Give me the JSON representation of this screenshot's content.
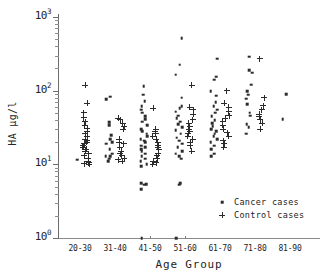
{
  "chart_data": {
    "type": "scatter",
    "title": "",
    "xlabel": "Age Group",
    "ylabel": "HA µg/l",
    "yscale": "log",
    "ylim": [
      1,
      1000
    ],
    "ytick_labels": [
      "10",
      "10",
      "10",
      "10"
    ],
    "ytick_exponents": [
      "0",
      "1",
      "2",
      "3"
    ],
    "ytick_values": [
      1,
      10,
      100,
      1000
    ],
    "grid": false,
    "categories": [
      "20-30",
      "31-40",
      "41-50",
      "51-60",
      "61-70",
      "71-80",
      "81-90"
    ],
    "legend_position": "lower-right",
    "series": [
      {
        "name": "Cancer cases",
        "marker": "dot",
        "color": "#2b2b2b",
        "points": [
          {
            "category": "20-30",
            "value": 11.5
          },
          {
            "category": "31-40",
            "value": 83
          },
          {
            "category": "31-40",
            "value": 76
          },
          {
            "category": "31-40",
            "value": 37
          },
          {
            "category": "31-40",
            "value": 34
          },
          {
            "category": "31-40",
            "value": 25
          },
          {
            "category": "31-40",
            "value": 22
          },
          {
            "category": "31-40",
            "value": 20
          },
          {
            "category": "31-40",
            "value": 19
          },
          {
            "category": "31-40",
            "value": 16
          },
          {
            "category": "31-40",
            "value": 14
          },
          {
            "category": "31-40",
            "value": 13
          },
          {
            "category": "31-40",
            "value": 13
          },
          {
            "category": "31-40",
            "value": 12
          },
          {
            "category": "31-40",
            "value": 11
          },
          {
            "category": "41-50",
            "value": 115
          },
          {
            "category": "41-50",
            "value": 88
          },
          {
            "category": "41-50",
            "value": 72
          },
          {
            "category": "41-50",
            "value": 62
          },
          {
            "category": "41-50",
            "value": 55
          },
          {
            "category": "41-50",
            "value": 50
          },
          {
            "category": "41-50",
            "value": 45
          },
          {
            "category": "41-50",
            "value": 41
          },
          {
            "category": "41-50",
            "value": 38
          },
          {
            "category": "41-50",
            "value": 34
          },
          {
            "category": "41-50",
            "value": 30
          },
          {
            "category": "41-50",
            "value": 28
          },
          {
            "category": "41-50",
            "value": 26
          },
          {
            "category": "41-50",
            "value": 24
          },
          {
            "category": "41-50",
            "value": 22
          },
          {
            "category": "41-50",
            "value": 21
          },
          {
            "category": "41-50",
            "value": 20
          },
          {
            "category": "41-50",
            "value": 18
          },
          {
            "category": "41-50",
            "value": 17
          },
          {
            "category": "41-50",
            "value": 16
          },
          {
            "category": "41-50",
            "value": 15
          },
          {
            "category": "41-50",
            "value": 14
          },
          {
            "category": "41-50",
            "value": 13
          },
          {
            "category": "41-50",
            "value": 12
          },
          {
            "category": "41-50",
            "value": 11
          },
          {
            "category": "41-50",
            "value": 10
          },
          {
            "category": "41-50",
            "value": 9.5
          },
          {
            "category": "41-50",
            "value": 5.5
          },
          {
            "category": "41-50",
            "value": 5.4
          },
          {
            "category": "41-50",
            "value": 5.3
          },
          {
            "category": "41-50",
            "value": 4.6
          },
          {
            "category": "41-50",
            "value": 1.0
          },
          {
            "category": "51-60",
            "value": 520
          },
          {
            "category": "51-60",
            "value": 225
          },
          {
            "category": "51-60",
            "value": 165
          },
          {
            "category": "51-60",
            "value": 80
          },
          {
            "category": "51-60",
            "value": 62
          },
          {
            "category": "51-60",
            "value": 58
          },
          {
            "category": "51-60",
            "value": 52
          },
          {
            "category": "51-60",
            "value": 46
          },
          {
            "category": "51-60",
            "value": 42
          },
          {
            "category": "51-60",
            "value": 38
          },
          {
            "category": "51-60",
            "value": 35
          },
          {
            "category": "51-60",
            "value": 32
          },
          {
            "category": "51-60",
            "value": 29
          },
          {
            "category": "51-60",
            "value": 26
          },
          {
            "category": "51-60",
            "value": 23
          },
          {
            "category": "51-60",
            "value": 21
          },
          {
            "category": "51-60",
            "value": 19
          },
          {
            "category": "51-60",
            "value": 17
          },
          {
            "category": "51-60",
            "value": 15
          },
          {
            "category": "51-60",
            "value": 14
          },
          {
            "category": "51-60",
            "value": 13
          },
          {
            "category": "51-60",
            "value": 12
          },
          {
            "category": "51-60",
            "value": 5.5
          },
          {
            "category": "51-60",
            "value": 5.3
          },
          {
            "category": "51-60",
            "value": 1.0
          },
          {
            "category": "61-70",
            "value": 270
          },
          {
            "category": "61-70",
            "value": 155
          },
          {
            "category": "61-70",
            "value": 140
          },
          {
            "category": "61-70",
            "value": 98
          },
          {
            "category": "61-70",
            "value": 85
          },
          {
            "category": "61-70",
            "value": 70
          },
          {
            "category": "61-70",
            "value": 62
          },
          {
            "category": "61-70",
            "value": 55
          },
          {
            "category": "61-70",
            "value": 50
          },
          {
            "category": "61-70",
            "value": 45
          },
          {
            "category": "61-70",
            "value": 40
          },
          {
            "category": "61-70",
            "value": 36
          },
          {
            "category": "61-70",
            "value": 33
          },
          {
            "category": "61-70",
            "value": 30
          },
          {
            "category": "61-70",
            "value": 28
          },
          {
            "category": "61-70",
            "value": 26
          },
          {
            "category": "61-70",
            "value": 24
          },
          {
            "category": "61-70",
            "value": 22
          },
          {
            "category": "61-70",
            "value": 20
          },
          {
            "category": "61-70",
            "value": 18
          },
          {
            "category": "61-70",
            "value": 16
          },
          {
            "category": "61-70",
            "value": 14
          },
          {
            "category": "61-70",
            "value": 13
          },
          {
            "category": "71-80",
            "value": 290
          },
          {
            "category": "71-80",
            "value": 190
          },
          {
            "category": "71-80",
            "value": 175
          },
          {
            "category": "71-80",
            "value": 120
          },
          {
            "category": "71-80",
            "value": 98
          },
          {
            "category": "71-80",
            "value": 88
          },
          {
            "category": "71-80",
            "value": 78
          },
          {
            "category": "71-80",
            "value": 66
          },
          {
            "category": "71-80",
            "value": 50
          },
          {
            "category": "71-80",
            "value": 46
          },
          {
            "category": "71-80",
            "value": 35
          },
          {
            "category": "71-80",
            "value": 32
          },
          {
            "category": "71-80",
            "value": 26
          },
          {
            "category": "81-90",
            "value": 90
          },
          {
            "category": "81-90",
            "value": 41
          }
        ]
      },
      {
        "name": "Control cases",
        "marker": "plus",
        "color": "#2b2b2b",
        "points": [
          {
            "category": "20-30",
            "value": 118
          },
          {
            "category": "20-30",
            "value": 68
          },
          {
            "category": "20-30",
            "value": 50
          },
          {
            "category": "20-30",
            "value": 43
          },
          {
            "category": "20-30",
            "value": 38
          },
          {
            "category": "20-30",
            "value": 34
          },
          {
            "category": "20-30",
            "value": 31
          },
          {
            "category": "20-30",
            "value": 28
          },
          {
            "category": "20-30",
            "value": 26
          },
          {
            "category": "20-30",
            "value": 24
          },
          {
            "category": "20-30",
            "value": 22
          },
          {
            "category": "20-30",
            "value": 21
          },
          {
            "category": "20-30",
            "value": 20
          },
          {
            "category": "20-30",
            "value": 19
          },
          {
            "category": "20-30",
            "value": 18
          },
          {
            "category": "20-30",
            "value": 17
          },
          {
            "category": "20-30",
            "value": 16
          },
          {
            "category": "20-30",
            "value": 15
          },
          {
            "category": "20-30",
            "value": 14
          },
          {
            "category": "20-30",
            "value": 13
          },
          {
            "category": "20-30",
            "value": 12
          },
          {
            "category": "20-30",
            "value": 11
          },
          {
            "category": "20-30",
            "value": 10.5
          },
          {
            "category": "20-30",
            "value": 10.2
          },
          {
            "category": "20-30",
            "value": 10
          },
          {
            "category": "31-40",
            "value": 42
          },
          {
            "category": "31-40",
            "value": 40
          },
          {
            "category": "31-40",
            "value": 36
          },
          {
            "category": "31-40",
            "value": 33
          },
          {
            "category": "31-40",
            "value": 30
          },
          {
            "category": "31-40",
            "value": 22
          },
          {
            "category": "31-40",
            "value": 20
          },
          {
            "category": "31-40",
            "value": 19
          },
          {
            "category": "31-40",
            "value": 17
          },
          {
            "category": "31-40",
            "value": 15
          },
          {
            "category": "31-40",
            "value": 14
          },
          {
            "category": "31-40",
            "value": 13
          },
          {
            "category": "31-40",
            "value": 12
          },
          {
            "category": "31-40",
            "value": 11.5
          },
          {
            "category": "31-40",
            "value": 11
          },
          {
            "category": "41-50",
            "value": 58
          },
          {
            "category": "41-50",
            "value": 30
          },
          {
            "category": "41-50",
            "value": 28
          },
          {
            "category": "41-50",
            "value": 26
          },
          {
            "category": "41-50",
            "value": 24
          },
          {
            "category": "41-50",
            "value": 22
          },
          {
            "category": "41-50",
            "value": 20
          },
          {
            "category": "41-50",
            "value": 18
          },
          {
            "category": "41-50",
            "value": 17
          },
          {
            "category": "41-50",
            "value": 16
          },
          {
            "category": "41-50",
            "value": 14
          },
          {
            "category": "41-50",
            "value": 13
          },
          {
            "category": "41-50",
            "value": 12
          },
          {
            "category": "41-50",
            "value": 11
          },
          {
            "category": "41-50",
            "value": 10.5
          },
          {
            "category": "41-50",
            "value": 10
          },
          {
            "category": "51-60",
            "value": 118
          },
          {
            "category": "51-60",
            "value": 60
          },
          {
            "category": "51-60",
            "value": 55
          },
          {
            "category": "51-60",
            "value": 48
          },
          {
            "category": "51-60",
            "value": 40
          },
          {
            "category": "51-60",
            "value": 36
          },
          {
            "category": "51-60",
            "value": 33
          },
          {
            "category": "51-60",
            "value": 30
          },
          {
            "category": "51-60",
            "value": 28
          },
          {
            "category": "51-60",
            "value": 26
          },
          {
            "category": "51-60",
            "value": 24
          },
          {
            "category": "51-60",
            "value": 22
          },
          {
            "category": "51-60",
            "value": 20
          },
          {
            "category": "51-60",
            "value": 18
          },
          {
            "category": "51-60",
            "value": 15
          },
          {
            "category": "61-70",
            "value": 100
          },
          {
            "category": "61-70",
            "value": 68
          },
          {
            "category": "61-70",
            "value": 60
          },
          {
            "category": "61-70",
            "value": 52
          },
          {
            "category": "61-70",
            "value": 46
          },
          {
            "category": "61-70",
            "value": 42
          },
          {
            "category": "61-70",
            "value": 38
          },
          {
            "category": "61-70",
            "value": 34
          },
          {
            "category": "61-70",
            "value": 30
          },
          {
            "category": "61-70",
            "value": 27
          },
          {
            "category": "61-70",
            "value": 24
          },
          {
            "category": "61-70",
            "value": 21
          },
          {
            "category": "61-70",
            "value": 19
          },
          {
            "category": "61-70",
            "value": 17
          },
          {
            "category": "71-80",
            "value": 270
          },
          {
            "category": "71-80",
            "value": 80
          },
          {
            "category": "71-80",
            "value": 62
          },
          {
            "category": "71-80",
            "value": 55
          },
          {
            "category": "71-80",
            "value": 48
          },
          {
            "category": "71-80",
            "value": 44
          },
          {
            "category": "71-80",
            "value": 40
          },
          {
            "category": "71-80",
            "value": 36
          },
          {
            "category": "71-80",
            "value": 30
          }
        ]
      }
    ]
  },
  "legend": {
    "items": [
      {
        "label": "Cancer cases",
        "marker": "dot"
      },
      {
        "label": "Control cases",
        "marker": "plus"
      }
    ]
  }
}
